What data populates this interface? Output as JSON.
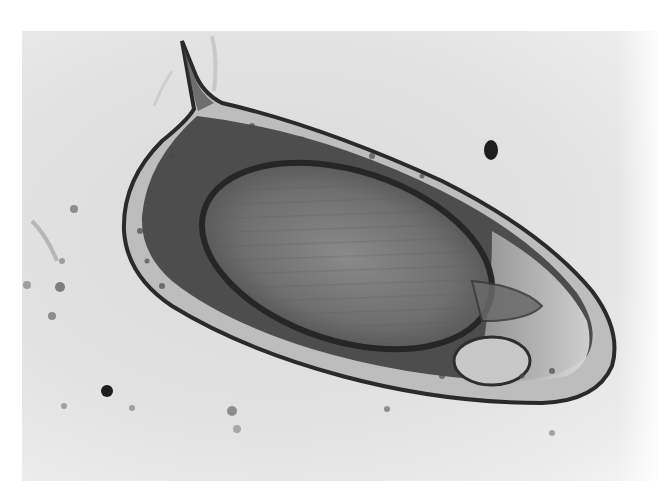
{
  "image": {
    "description": "Grayscale light micrograph of a spined parasite egg (lateral-spined ovoid egg containing a developed miracidium) on a pale background with scattered debris particles",
    "subject": "spined-ovoid-egg",
    "colors": {
      "background": "#e0e0e0",
      "shell_outline": "#2a2a2a",
      "inner_body": "#6e6e6e",
      "dark_band": "#2f2f2f",
      "clear_tip": "#d4d4d4",
      "debris": "#3a3a3a"
    }
  }
}
